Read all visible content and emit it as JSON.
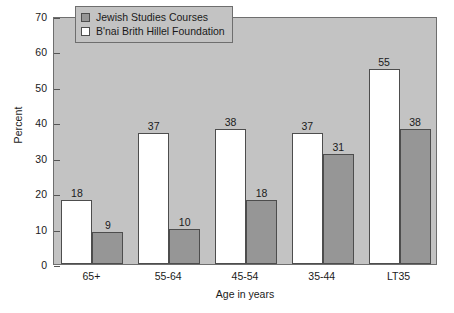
{
  "chart_data": {
    "type": "bar",
    "title": "",
    "subtitle": "",
    "xlabel": "Age in years",
    "ylabel": "Percent",
    "categories": [
      "65+",
      "55-64",
      "45-54",
      "35-44",
      "LT35"
    ],
    "series": [
      {
        "name": "Jewish Studies Courses",
        "color": "#969696",
        "values": [
          9,
          10,
          18,
          31,
          38
        ]
      },
      {
        "name": "B'nai Brith Hillel Foundation",
        "color": "#ffffff",
        "values": [
          18,
          37,
          38,
          37,
          55
        ]
      }
    ],
    "ylim": [
      0,
      70
    ],
    "yticks": [
      0,
      10,
      20,
      30,
      40,
      50,
      60,
      70
    ],
    "ytick_labels": [
      "0",
      "10",
      "20",
      "30",
      "40",
      "50",
      "60",
      "70"
    ],
    "grid": false,
    "data_labels": true,
    "legend_position": "top-center-inside",
    "plot_background": "#c3c3c3",
    "figure_background": "#ffffff",
    "axis_color": "#6e6e6e",
    "bar_order_in_group": [
      "B'nai Brith Hillel Foundation",
      "Jewish Studies Courses"
    ]
  },
  "legend": {
    "entries": [
      {
        "label": "Jewish Studies Courses",
        "swatch": "gray-swatch"
      },
      {
        "label": "B'nai Brith Hillel Foundation",
        "swatch": "white-swatch"
      }
    ]
  }
}
